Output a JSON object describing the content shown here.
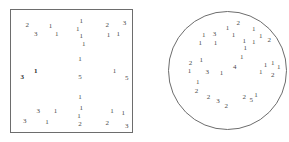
{
  "figure": {
    "title": "",
    "background_color": "#ffffff",
    "stroke_color": "#6d6d6d",
    "label_color": "#4a4a4a",
    "panel_count": 2
  },
  "chart_data": {
    "type": "scatter",
    "title": "",
    "subtitle": "",
    "xlabel": "",
    "ylabel": "",
    "grid": false,
    "legend": "none",
    "panels": [
      {
        "name": "square-region",
        "shape": "square",
        "shape_label": "square",
        "point_count": 34,
        "points": [
          {
            "label": "2",
            "x": 0.14,
            "y": 0.13,
            "bold": false
          },
          {
            "label": "1",
            "x": 0.33,
            "y": 0.14,
            "bold": false
          },
          {
            "label": "3",
            "x": 0.21,
            "y": 0.2,
            "bold": false
          },
          {
            "label": "1",
            "x": 0.38,
            "y": 0.2,
            "bold": false
          },
          {
            "label": "1",
            "x": 0.58,
            "y": 0.1,
            "bold": false
          },
          {
            "label": "1",
            "x": 0.55,
            "y": 0.16,
            "bold": false
          },
          {
            "label": "1",
            "x": 0.58,
            "y": 0.22,
            "bold": false
          },
          {
            "label": "1",
            "x": 0.6,
            "y": 0.28,
            "bold": false
          },
          {
            "label": "1",
            "x": 0.57,
            "y": 0.4,
            "bold": false
          },
          {
            "label": "2",
            "x": 0.79,
            "y": 0.13,
            "bold": false
          },
          {
            "label": "3",
            "x": 0.93,
            "y": 0.11,
            "bold": false
          },
          {
            "label": "1",
            "x": 0.8,
            "y": 0.21,
            "bold": false
          },
          {
            "label": "1",
            "x": 0.88,
            "y": 0.2,
            "bold": false
          },
          {
            "label": "3",
            "x": 0.1,
            "y": 0.55,
            "bold": true
          },
          {
            "label": "1",
            "x": 0.21,
            "y": 0.5,
            "bold": true
          },
          {
            "label": "5",
            "x": 0.57,
            "y": 0.55,
            "bold": false
          },
          {
            "label": "1",
            "x": 0.85,
            "y": 0.5,
            "bold": false
          },
          {
            "label": "5",
            "x": 0.95,
            "y": 0.56,
            "bold": false
          },
          {
            "label": "1",
            "x": 0.57,
            "y": 0.71,
            "bold": false
          },
          {
            "label": "3",
            "x": 0.23,
            "y": 0.82,
            "bold": false
          },
          {
            "label": "1",
            "x": 0.37,
            "y": 0.82,
            "bold": false
          },
          {
            "label": "3",
            "x": 0.12,
            "y": 0.9,
            "bold": false
          },
          {
            "label": "1",
            "x": 0.3,
            "y": 0.91,
            "bold": false
          },
          {
            "label": "1",
            "x": 0.58,
            "y": 0.8,
            "bold": false
          },
          {
            "label": "1",
            "x": 0.56,
            "y": 0.86,
            "bold": false
          },
          {
            "label": "2",
            "x": 0.57,
            "y": 0.93,
            "bold": false
          },
          {
            "label": "1",
            "x": 0.83,
            "y": 0.82,
            "bold": false
          },
          {
            "label": "1",
            "x": 0.92,
            "y": 0.84,
            "bold": false
          },
          {
            "label": "2",
            "x": 0.79,
            "y": 0.92,
            "bold": false
          },
          {
            "label": "3",
            "x": 0.95,
            "y": 0.94,
            "bold": false
          }
        ]
      },
      {
        "name": "circle-region",
        "shape": "circle",
        "shape_label": "circle",
        "point_count": 41,
        "points": [
          {
            "label": "1",
            "x": 0.5,
            "y": 0.14,
            "bold": false
          },
          {
            "label": "2",
            "x": 0.59,
            "y": 0.1,
            "bold": false
          },
          {
            "label": "1",
            "x": 0.72,
            "y": 0.15,
            "bold": false
          },
          {
            "label": "1",
            "x": 0.3,
            "y": 0.2,
            "bold": false
          },
          {
            "label": "3",
            "x": 0.39,
            "y": 0.19,
            "bold": false
          },
          {
            "label": "1",
            "x": 0.55,
            "y": 0.2,
            "bold": false
          },
          {
            "label": "1",
            "x": 0.78,
            "y": 0.21,
            "bold": false
          },
          {
            "label": "1",
            "x": 0.27,
            "y": 0.27,
            "bold": false
          },
          {
            "label": "1",
            "x": 0.4,
            "y": 0.27,
            "bold": false
          },
          {
            "label": "1",
            "x": 0.64,
            "y": 0.25,
            "bold": false
          },
          {
            "label": "1",
            "x": 0.72,
            "y": 0.26,
            "bold": false
          },
          {
            "label": "2",
            "x": 0.85,
            "y": 0.24,
            "bold": false
          },
          {
            "label": "1",
            "x": 0.65,
            "y": 0.31,
            "bold": false
          },
          {
            "label": "1",
            "x": 0.62,
            "y": 0.39,
            "bold": false
          },
          {
            "label": "2",
            "x": 0.19,
            "y": 0.44,
            "bold": false
          },
          {
            "label": "1",
            "x": 0.28,
            "y": 0.41,
            "bold": false
          },
          {
            "label": "1",
            "x": 0.18,
            "y": 0.5,
            "bold": false
          },
          {
            "label": "3",
            "x": 0.33,
            "y": 0.51,
            "bold": false
          },
          {
            "label": "4",
            "x": 0.56,
            "y": 0.47,
            "bold": false
          },
          {
            "label": "1",
            "x": 0.45,
            "y": 0.52,
            "bold": false
          },
          {
            "label": "1",
            "x": 0.82,
            "y": 0.45,
            "bold": false
          },
          {
            "label": "1",
            "x": 0.88,
            "y": 0.44,
            "bold": false
          },
          {
            "label": "1",
            "x": 0.93,
            "y": 0.47,
            "bold": false
          },
          {
            "label": "1",
            "x": 0.78,
            "y": 0.51,
            "bold": false
          },
          {
            "label": "2",
            "x": 0.88,
            "y": 0.54,
            "bold": false
          },
          {
            "label": "1",
            "x": 0.25,
            "y": 0.6,
            "bold": false
          },
          {
            "label": "2",
            "x": 0.24,
            "y": 0.67,
            "bold": false
          },
          {
            "label": "2",
            "x": 0.34,
            "y": 0.72,
            "bold": false
          },
          {
            "label": "3",
            "x": 0.42,
            "y": 0.76,
            "bold": false
          },
          {
            "label": "2",
            "x": 0.49,
            "y": 0.8,
            "bold": false
          },
          {
            "label": "2",
            "x": 0.64,
            "y": 0.72,
            "bold": false
          },
          {
            "label": "5",
            "x": 0.7,
            "y": 0.75,
            "bold": false
          },
          {
            "label": "1",
            "x": 0.74,
            "y": 0.71,
            "bold": false
          }
        ]
      }
    ]
  }
}
